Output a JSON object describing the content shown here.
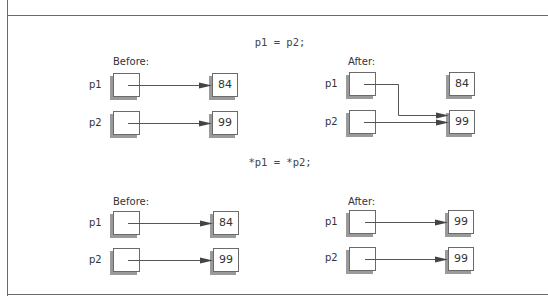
{
  "figure": {
    "sections": [
      {
        "statement": "p1 = p2;",
        "before": {
          "label": "Before:",
          "pointers": [
            {
              "name": "p1",
              "points_to": "84"
            },
            {
              "name": "p2",
              "points_to": "99"
            }
          ],
          "values": [
            "84",
            "99"
          ]
        },
        "after": {
          "label": "After:",
          "pointers": [
            {
              "name": "p1",
              "points_to": "99"
            },
            {
              "name": "p2",
              "points_to": "99"
            }
          ],
          "values": [
            "84",
            "99"
          ]
        }
      },
      {
        "statement": "*p1 = *p2;",
        "before": {
          "label": "Before:",
          "pointers": [
            {
              "name": "p1",
              "points_to": "84"
            },
            {
              "name": "p2",
              "points_to": "99"
            }
          ],
          "values": [
            "84",
            "99"
          ]
        },
        "after": {
          "label": "After:",
          "pointers": [
            {
              "name": "p1",
              "points_to": "99 (top)"
            },
            {
              "name": "p2",
              "points_to": "99 (bottom)"
            }
          ],
          "values": [
            "99",
            "99"
          ]
        }
      }
    ]
  },
  "colors": {
    "frame": "#6a6a6a",
    "box_border": "#6a6a6a",
    "box_shadow": "#9a9a9a",
    "arrow": "#555555",
    "text": "#333333"
  }
}
